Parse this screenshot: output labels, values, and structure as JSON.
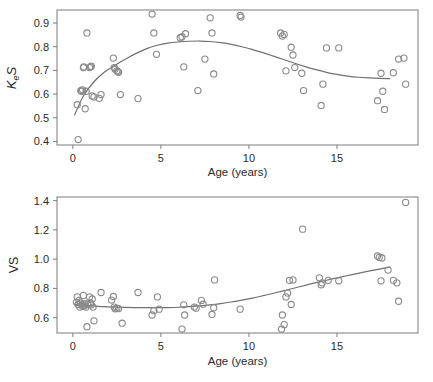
{
  "figure": {
    "panels": [
      "keS-vs-age",
      "vs-vs-age"
    ]
  },
  "chart_data": [
    {
      "id": "panel-top",
      "type": "scatter",
      "title": "",
      "xlabel": "Age (years)",
      "ylabel": "KeS",
      "ylabel_parts": {
        "main": "K",
        "sub": "e",
        "tail": "S"
      },
      "xlim": [
        -0.9,
        19.6
      ],
      "ylim": [
        0.385,
        0.955
      ],
      "xticks": [
        0,
        5,
        10,
        15
      ],
      "xticklabels": [
        "0",
        "5",
        "10",
        "15"
      ],
      "yticks": [
        0.4,
        0.5,
        0.6,
        0.7,
        0.8,
        0.9
      ],
      "yticklabels": [
        "0.4",
        "0.5",
        "0.6",
        "0.7",
        "0.8",
        "0.9"
      ],
      "grid": false,
      "legend": "none",
      "marker": "open-circle",
      "x": [
        0.25,
        0.3,
        0.45,
        0.5,
        0.55,
        0.6,
        0.62,
        0.7,
        0.75,
        0.8,
        0.95,
        1.0,
        1.05,
        1.1,
        1.2,
        1.5,
        1.6,
        2.3,
        2.35,
        2.4,
        2.5,
        2.55,
        2.6,
        2.7,
        3.7,
        4.5,
        4.6,
        4.75,
        6.1,
        6.2,
        6.3,
        6.4,
        7.1,
        7.5,
        7.8,
        7.9,
        8.0,
        9.5,
        9.55,
        11.8,
        11.9,
        12.0,
        12.1,
        12.4,
        12.5,
        12.6,
        13.0,
        13.1,
        14.1,
        14.2,
        14.4,
        15.1,
        17.3,
        17.5,
        17.6,
        17.7,
        18.2,
        18.5,
        18.8,
        18.9
      ],
      "y": [
        0.555,
        0.408,
        0.615,
        0.612,
        0.618,
        0.712,
        0.715,
        0.538,
        0.612,
        0.858,
        0.712,
        0.715,
        0.718,
        0.592,
        0.588,
        0.582,
        0.598,
        0.752,
        0.712,
        0.705,
        0.698,
        0.695,
        0.692,
        0.598,
        0.581,
        0.938,
        0.858,
        0.768,
        0.838,
        0.842,
        0.715,
        0.855,
        0.615,
        0.748,
        0.922,
        0.858,
        0.685,
        0.932,
        0.925,
        0.858,
        0.845,
        0.852,
        0.698,
        0.798,
        0.765,
        0.712,
        0.688,
        0.615,
        0.552,
        0.642,
        0.795,
        0.795,
        0.572,
        0.688,
        0.612,
        0.535,
        0.69,
        0.748,
        0.752,
        0.642
      ],
      "trend": {
        "type": "loess",
        "x": [
          0.1,
          0.6,
          1.2,
          1.8,
          2.4,
          3.0,
          3.6,
          4.2,
          4.8,
          5.4,
          6.0,
          6.6,
          7.2,
          7.8,
          8.4,
          9.0,
          9.6,
          10.2,
          10.8,
          11.4,
          12.0,
          12.6,
          13.2,
          13.8,
          14.4,
          15.0,
          15.6,
          16.2,
          16.8,
          17.4,
          18.0
        ],
        "y": [
          0.512,
          0.592,
          0.652,
          0.693,
          0.722,
          0.748,
          0.772,
          0.792,
          0.806,
          0.815,
          0.82,
          0.823,
          0.824,
          0.822,
          0.817,
          0.81,
          0.8,
          0.788,
          0.775,
          0.76,
          0.745,
          0.73,
          0.716,
          0.703,
          0.692,
          0.683,
          0.676,
          0.671,
          0.668,
          0.666,
          0.665
        ]
      }
    },
    {
      "id": "panel-bottom",
      "type": "scatter",
      "title": "",
      "xlabel": "Age (years)",
      "ylabel": "VS",
      "xlim": [
        -0.9,
        19.6
      ],
      "ylim": [
        0.495,
        1.425
      ],
      "xticks": [
        0,
        5,
        10,
        15
      ],
      "xticklabels": [
        "0",
        "5",
        "10",
        "15"
      ],
      "yticks": [
        0.6,
        0.8,
        1.0,
        1.2,
        1.4
      ],
      "yticklabels": [
        "0.6",
        "0.8",
        "1.0",
        "1.2",
        "1.4"
      ],
      "grid": false,
      "legend": "none",
      "marker": "open-circle",
      "x": [
        0.2,
        0.25,
        0.3,
        0.35,
        0.4,
        0.45,
        0.5,
        0.55,
        0.6,
        0.65,
        0.7,
        0.75,
        0.8,
        0.85,
        0.95,
        1.0,
        1.05,
        1.1,
        1.15,
        1.2,
        1.6,
        2.2,
        2.3,
        2.35,
        2.4,
        2.5,
        2.6,
        2.8,
        3.7,
        4.5,
        4.6,
        4.8,
        4.9,
        6.2,
        6.3,
        6.35,
        6.9,
        7.0,
        7.3,
        7.4,
        7.9,
        8.0,
        8.05,
        9.5,
        11.85,
        11.9,
        12.0,
        12.1,
        12.2,
        12.3,
        12.4,
        12.5,
        13.05,
        14.0,
        14.1,
        14.15,
        14.5,
        15.1,
        17.3,
        17.4,
        17.5,
        17.55,
        17.9,
        18.2,
        18.4,
        18.5,
        18.9
      ],
      "y": [
        0.705,
        0.742,
        0.69,
        0.718,
        0.672,
        0.7,
        0.688,
        0.678,
        0.752,
        0.682,
        0.695,
        0.672,
        0.538,
        0.69,
        0.742,
        0.7,
        0.688,
        0.728,
        0.672,
        0.578,
        0.772,
        0.72,
        0.745,
        0.672,
        0.66,
        0.665,
        0.662,
        0.562,
        0.772,
        0.618,
        0.648,
        0.742,
        0.658,
        0.522,
        0.688,
        0.618,
        0.672,
        0.665,
        0.718,
        0.692,
        0.622,
        0.668,
        0.858,
        0.658,
        0.522,
        0.618,
        0.552,
        0.742,
        0.768,
        0.855,
        0.69,
        0.858,
        1.205,
        0.872,
        0.825,
        0.838,
        0.855,
        0.852,
        1.022,
        1.012,
        0.852,
        1.008,
        0.925,
        0.855,
        0.838,
        0.712,
        1.388
      ],
      "trend": {
        "type": "loess",
        "x": [
          0.1,
          0.6,
          1.2,
          1.8,
          2.4,
          3.0,
          3.6,
          4.2,
          4.8,
          5.4,
          6.0,
          6.6,
          7.2,
          7.8,
          8.4,
          9.0,
          9.6,
          10.2,
          10.8,
          11.4,
          12.0,
          12.6,
          13.2,
          13.8,
          14.4,
          15.0,
          15.6,
          16.2,
          16.8,
          17.4,
          18.0
        ],
        "y": [
          0.692,
          0.686,
          0.68,
          0.675,
          0.672,
          0.67,
          0.669,
          0.668,
          0.668,
          0.669,
          0.671,
          0.675,
          0.68,
          0.687,
          0.696,
          0.707,
          0.72,
          0.734,
          0.75,
          0.767,
          0.785,
          0.803,
          0.821,
          0.839,
          0.856,
          0.872,
          0.888,
          0.903,
          0.918,
          0.932,
          0.945
        ]
      }
    }
  ]
}
